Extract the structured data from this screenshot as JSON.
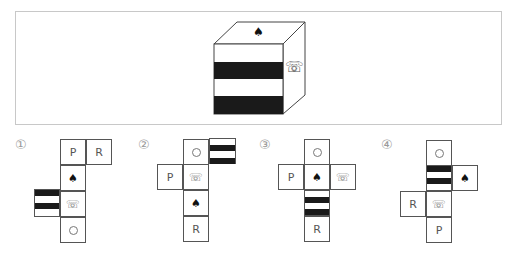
{
  "question": {
    "cube": {
      "top_face": {
        "symbol": "♠",
        "icon": "spade-icon"
      },
      "front_face": {
        "pattern": "two-black-stripes",
        "stripe_color": "#1a1a1a"
      },
      "right_face": {
        "symbol": "☏",
        "icon": "telephone-icon"
      }
    }
  },
  "options": [
    {
      "label": "①",
      "faces": [
        {
          "content": "P",
          "type": "text"
        },
        {
          "content": "R",
          "type": "text"
        },
        {
          "content": "♠",
          "type": "spade"
        },
        {
          "content": "stripes",
          "type": "stripes"
        },
        {
          "content": "☏",
          "type": "phone"
        },
        {
          "content": "○",
          "type": "circle"
        }
      ]
    },
    {
      "label": "②",
      "faces": [
        {
          "content": "○",
          "type": "circle"
        },
        {
          "content": "stripes",
          "type": "stripes"
        },
        {
          "content": "P",
          "type": "text"
        },
        {
          "content": "☏",
          "type": "phone"
        },
        {
          "content": "♠",
          "type": "spade"
        },
        {
          "content": "R",
          "type": "text"
        }
      ]
    },
    {
      "label": "③",
      "faces": [
        {
          "content": "○",
          "type": "circle"
        },
        {
          "content": "P",
          "type": "text"
        },
        {
          "content": "♠",
          "type": "spade"
        },
        {
          "content": "☏",
          "type": "phone"
        },
        {
          "content": "stripes",
          "type": "stripes"
        },
        {
          "content": "R",
          "type": "text"
        }
      ]
    },
    {
      "label": "④",
      "faces": [
        {
          "content": "○",
          "type": "circle"
        },
        {
          "content": "stripes",
          "type": "stripes"
        },
        {
          "content": "♠",
          "type": "spade"
        },
        {
          "content": "R",
          "type": "text"
        },
        {
          "content": "☏",
          "type": "phone"
        },
        {
          "content": "P",
          "type": "text"
        }
      ]
    }
  ]
}
